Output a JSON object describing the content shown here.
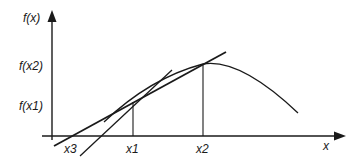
{
  "diagram": {
    "colors": {
      "stroke": "#1a1a1a",
      "background": "#ffffff"
    },
    "axes": {
      "y_label": "f(x)",
      "x_label": "x"
    },
    "y_ticks": [
      {
        "label": "f(x2)"
      },
      {
        "label": "f(x1)"
      }
    ],
    "x_ticks": [
      {
        "label": "x3"
      },
      {
        "label": "x1"
      },
      {
        "label": "x2"
      }
    ],
    "elements": [
      {
        "name": "curve",
        "description": "concave function f(x) rising to a peak then falling"
      },
      {
        "name": "secant-line",
        "description": "line through (x1,f(x1)) and (x2,f(x2)) crossing x-axis at x3"
      },
      {
        "name": "steep-line",
        "description": "steeper line through (x1,f(x1))"
      }
    ]
  }
}
